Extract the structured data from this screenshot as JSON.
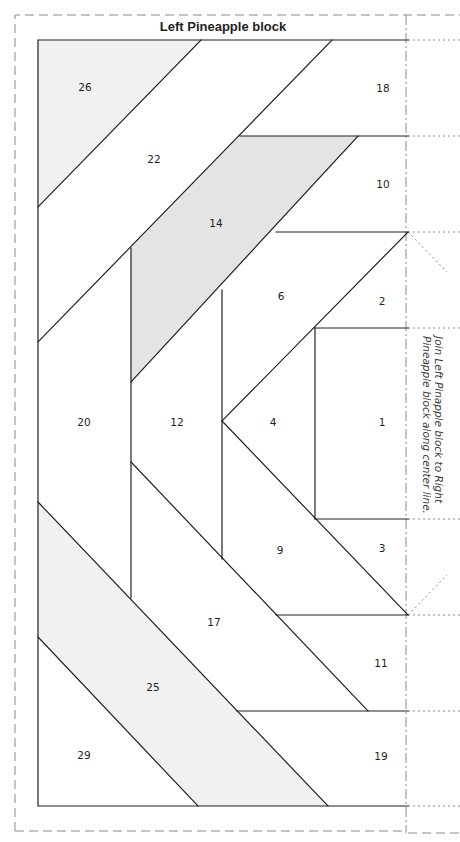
{
  "title": "Left Pineapple block",
  "side_note": {
    "line1": "Join Left Pinapple block to Right",
    "line2": "Pineapple block along center line."
  },
  "colors": {
    "line": "#231f20",
    "shade_dark": "#e4e4e4",
    "shade_light": "#f1f1f1",
    "guide": "#8a8a8a"
  },
  "pieces": [
    {
      "id": "26",
      "label": "26",
      "x": 85,
      "y": 87
    },
    {
      "id": "18",
      "label": "18",
      "x": 383,
      "y": 88
    },
    {
      "id": "22",
      "label": "22",
      "x": 154,
      "y": 159
    },
    {
      "id": "10",
      "label": "10",
      "x": 383,
      "y": 184
    },
    {
      "id": "14",
      "label": "14",
      "x": 216,
      "y": 223
    },
    {
      "id": "6",
      "label": "6",
      "x": 281,
      "y": 296
    },
    {
      "id": "2",
      "label": "2",
      "x": 382,
      "y": 301
    },
    {
      "id": "20",
      "label": "20",
      "x": 84,
      "y": 422
    },
    {
      "id": "12",
      "label": "12",
      "x": 177,
      "y": 422
    },
    {
      "id": "4",
      "label": "4",
      "x": 273,
      "y": 422
    },
    {
      "id": "1",
      "label": "1",
      "x": 382,
      "y": 422
    },
    {
      "id": "3",
      "label": "3",
      "x": 382,
      "y": 548
    },
    {
      "id": "9",
      "label": "9",
      "x": 280,
      "y": 550
    },
    {
      "id": "17",
      "label": "17",
      "x": 214,
      "y": 622
    },
    {
      "id": "11",
      "label": "11",
      "x": 381,
      "y": 663
    },
    {
      "id": "25",
      "label": "25",
      "x": 153,
      "y": 687
    },
    {
      "id": "29",
      "label": "29",
      "x": 84,
      "y": 755
    },
    {
      "id": "19",
      "label": "19",
      "x": 381,
      "y": 756
    }
  ]
}
